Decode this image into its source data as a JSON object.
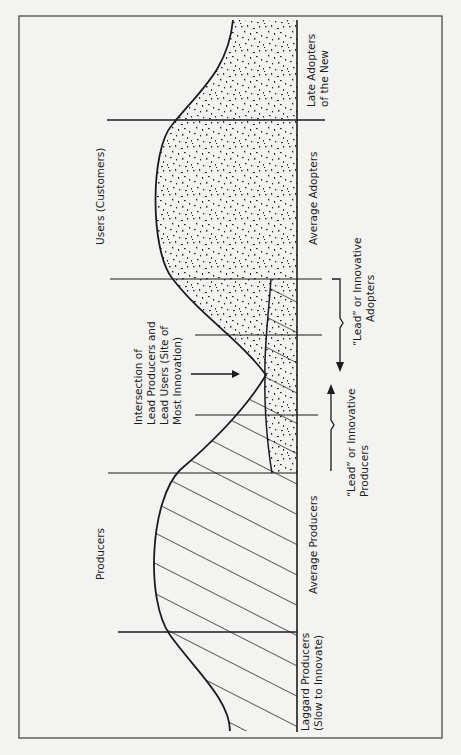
{
  "diagram": {
    "orientation": "rotated 90deg counter-clockwise (read bottom-to-top)",
    "colors": {
      "background": "#f3f3f1",
      "ink": "#1c1c1c",
      "frame": "#4a4a4a"
    },
    "groups": {
      "producers": "Producers",
      "users": "Users (Customers)"
    },
    "segments": {
      "laggard_producers": [
        "Laggard Producers",
        "(Slow to Innovate)"
      ],
      "average_producers": "Average Producers",
      "average_adopters": "Average Adopters",
      "late_adopters": [
        "Late Adopters",
        "of the New"
      ]
    },
    "braces": {
      "lead_producers": [
        "“Lead” or Innovative",
        "Producers"
      ],
      "lead_adopters": [
        "“Lead” or Innovative",
        "Adopters"
      ]
    },
    "intersection": [
      "Intersection of",
      "Lead Producers and",
      "Lead Users (Site of",
      "Most Innovation)"
    ],
    "fills": {
      "producers": "diagonal-hatch",
      "users": "stipple"
    }
  }
}
